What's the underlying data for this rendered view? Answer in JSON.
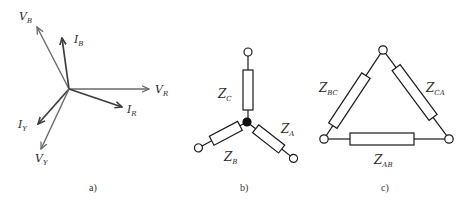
{
  "figure": {
    "panels": [
      {
        "id": "a",
        "caption": "a)",
        "type": "phasor-diagram",
        "phasors": [
          {
            "main": "V",
            "sub": "B"
          },
          {
            "main": "I",
            "sub": "B"
          },
          {
            "main": "V",
            "sub": "R"
          },
          {
            "main": "I",
            "sub": "R"
          },
          {
            "main": "I",
            "sub": "Y"
          },
          {
            "main": "V",
            "sub": "Y"
          }
        ]
      },
      {
        "id": "b",
        "caption": "b)",
        "type": "star-connection",
        "impedances": [
          {
            "main": "Z",
            "sub": "C"
          },
          {
            "main": "Z",
            "sub": "A"
          },
          {
            "main": "Z",
            "sub": "B"
          }
        ]
      },
      {
        "id": "c",
        "caption": "c)",
        "type": "delta-connection",
        "impedances": [
          {
            "main": "Z",
            "sub": "BC"
          },
          {
            "main": "Z",
            "sub": "CA"
          },
          {
            "main": "Z",
            "sub": "AB"
          }
        ]
      }
    ],
    "colors": {
      "voltage_phasor": "#6a6a6a",
      "current_phasor": "#4a4a4a",
      "wire": "#1a1a1a",
      "background": "#ffffff"
    }
  }
}
